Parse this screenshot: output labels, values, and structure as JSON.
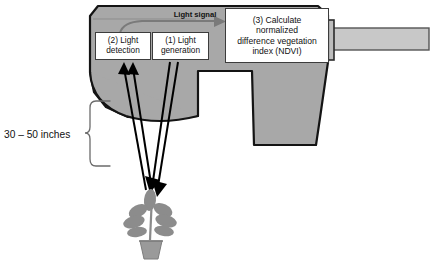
{
  "diagram": {
    "type": "labeled-schematic"
  },
  "labels": {
    "light_signal": "Light signal",
    "distance": "30 – 50 inches"
  },
  "steps": [
    {
      "id": "light-detection",
      "text": "(2) Light\ndetection"
    },
    {
      "id": "light-generation",
      "text": "(1) Light\ngeneration"
    },
    {
      "id": "ndvi-calculation",
      "text": "(3) Calculate normalized difference vegetation index (NDVI)"
    }
  ],
  "step_text": {
    "detection_line1": "(2) Light",
    "detection_line2": "detection",
    "generation_line1": "(1) Light",
    "generation_line2": "generation",
    "ndvi_line1": "(3) Calculate",
    "ndvi_line2": "normalized",
    "ndvi_line3": "difference vegetation",
    "ndvi_line4": "index (NDVI)"
  },
  "colors": {
    "sensor_body": "#a8a8a8",
    "sensor_outline": "#141414",
    "pole": "#c8c8c8",
    "pole_outline": "#4a4a4a",
    "beam": "#000000",
    "signal_arrow": "#7a7a7a",
    "plant": "#8c8c8c",
    "pot": "#9a9a9a",
    "brace": "#6b6b6b",
    "box_fill": "#ffffff",
    "box_border": "#3c3c3c",
    "background": "#ffffff"
  },
  "graphics": {
    "sensor_head": "sensor-head-shape",
    "sensor_grip": "sensor-grip-shape",
    "mounting_pole": "mounting-pole",
    "plant": "potted-plant",
    "beams_down": 2,
    "beams_up": 2,
    "distance_brace": "curly-brace"
  }
}
